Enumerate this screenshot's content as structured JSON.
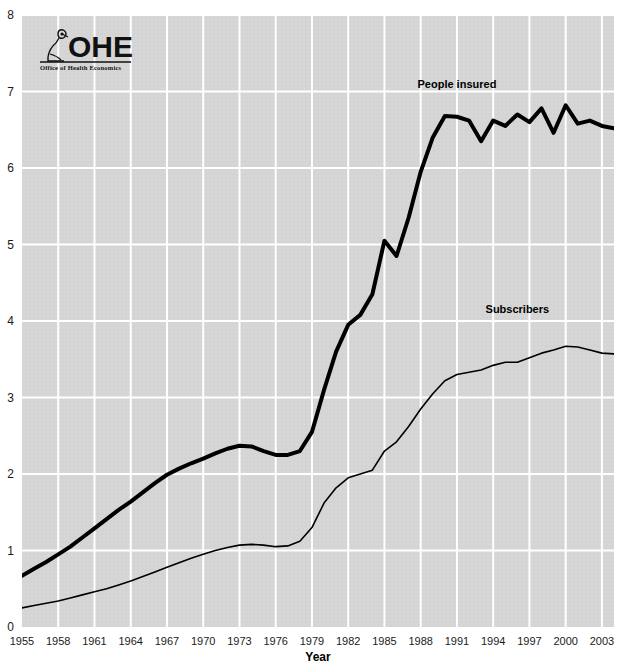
{
  "logo": {
    "name": "OHE",
    "subtitle": "Office of Health Economics",
    "icon": "microscope-icon"
  },
  "chart_data": {
    "type": "line",
    "title": "",
    "xlabel": "Year",
    "ylabel": "",
    "xlim": [
      1955,
      2004
    ],
    "ylim": [
      0,
      8
    ],
    "grid": true,
    "legend_position": "inline-annotations",
    "xticks": [
      1955,
      1958,
      1961,
      1964,
      1967,
      1970,
      1973,
      1976,
      1979,
      1982,
      1985,
      1988,
      1991,
      1994,
      1997,
      2000,
      2003
    ],
    "yticks": [
      0,
      1,
      2,
      3,
      4,
      5,
      6,
      7,
      8
    ],
    "background_color": "#d5d5d5",
    "gridline_color": "#ffffff",
    "line_color": "#000000",
    "x": [
      1955,
      1956,
      1957,
      1958,
      1959,
      1960,
      1961,
      1962,
      1963,
      1964,
      1965,
      1966,
      1967,
      1968,
      1969,
      1970,
      1971,
      1972,
      1973,
      1974,
      1975,
      1976,
      1977,
      1978,
      1979,
      1980,
      1981,
      1982,
      1983,
      1984,
      1985,
      1986,
      1987,
      1988,
      1989,
      1990,
      1991,
      1992,
      1993,
      1994,
      1995,
      1996,
      1997,
      1998,
      1999,
      2000,
      2001,
      2002,
      2003,
      2004
    ],
    "series": [
      {
        "name": "People insured",
        "label": "People insured",
        "stroke_width": 4,
        "values": [
          0.67,
          0.76,
          0.85,
          0.95,
          1.05,
          1.17,
          1.29,
          1.41,
          1.53,
          1.64,
          1.76,
          1.88,
          1.99,
          2.07,
          2.14,
          2.2,
          2.27,
          2.33,
          2.37,
          2.36,
          2.3,
          2.25,
          2.25,
          2.3,
          2.55,
          3.1,
          3.6,
          3.95,
          4.08,
          4.35,
          5.05,
          4.85,
          5.35,
          5.95,
          6.4,
          6.68,
          6.67,
          6.62,
          6.35,
          6.62,
          6.55,
          6.7,
          6.6,
          6.78,
          6.46,
          6.82,
          6.58,
          6.62,
          6.55,
          6.52
        ]
      },
      {
        "name": "Subscribers",
        "label": "Subscribers",
        "stroke_width": 1.6,
        "values": [
          0.25,
          0.28,
          0.31,
          0.34,
          0.38,
          0.42,
          0.46,
          0.5,
          0.55,
          0.6,
          0.66,
          0.72,
          0.78,
          0.84,
          0.9,
          0.95,
          1.0,
          1.04,
          1.07,
          1.08,
          1.07,
          1.05,
          1.06,
          1.12,
          1.3,
          1.62,
          1.82,
          1.95,
          2.0,
          2.05,
          2.3,
          2.42,
          2.62,
          2.85,
          3.05,
          3.22,
          3.3,
          3.33,
          3.36,
          3.42,
          3.46,
          3.46,
          3.52,
          3.58,
          3.62,
          3.67,
          3.66,
          3.62,
          3.58,
          3.57
        ]
      }
    ],
    "annotations": [
      {
        "text": "People insured",
        "x": 1991,
        "y": 7.05
      },
      {
        "text": "Subscribers",
        "x": 1996,
        "y": 4.1
      }
    ]
  }
}
